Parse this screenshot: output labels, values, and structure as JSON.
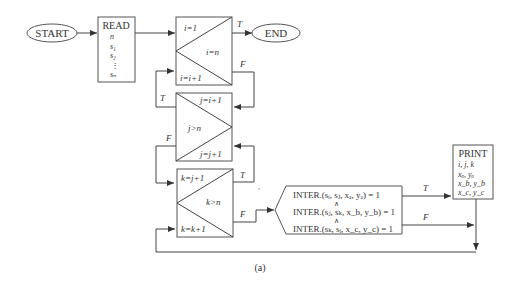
{
  "figure": {
    "caption": "(a)",
    "start": {
      "label": "START"
    },
    "end": {
      "label": "END"
    },
    "read": {
      "title": "READ",
      "items": [
        "n",
        "s₁",
        "s₂",
        "⋮",
        "sₙ"
      ]
    },
    "loop_i": {
      "init": "i=1",
      "cond": "i=n",
      "incr": "i=i+1",
      "true": "T",
      "false": "F"
    },
    "loop_j": {
      "init": "j=i+1",
      "cond": "j>n",
      "incr": "j=j+1",
      "true": "T",
      "false": "F"
    },
    "loop_k": {
      "init": "k=j+1",
      "cond": "k>n",
      "incr": "k=k+1",
      "true": "T",
      "false": "F"
    },
    "decision": {
      "lines": [
        "INTER.(sᵢ, sⱼ, xₐ, yₐ) = 1",
        "∧",
        "INTER.(sⱼ, sₖ, x_b, y_b) = 1",
        "∧",
        "INTER.(sₖ, sᵢ, x_c, y_c) = 1"
      ],
      "true": "T",
      "false": "F"
    },
    "print": {
      "title": "PRINT",
      "items": [
        "i, j, k",
        "xₐ, yₐ",
        "x_b, y_b",
        "x_c, y_c"
      ]
    }
  }
}
